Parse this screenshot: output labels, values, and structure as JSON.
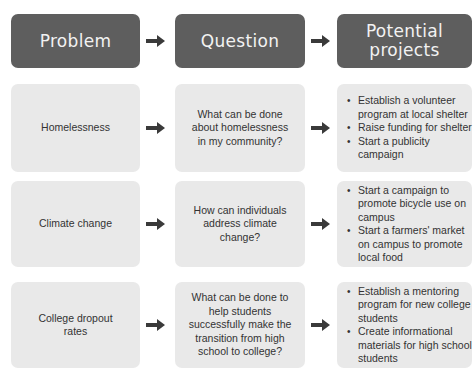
{
  "headers": {
    "problem": "Problem",
    "question": "Question",
    "projects_line1": "Potential",
    "projects_line2": "projects"
  },
  "rows": [
    {
      "problem": "Homelessness",
      "question": "What can be done about homelessness in my community?",
      "projects": [
        "Establish a volunteer program at local shelter",
        "Raise funding for shelter",
        "Start a publicity campaign"
      ]
    },
    {
      "problem": "Climate change",
      "question": "How can individuals address climate change?",
      "projects": [
        "Start a campaign to promote bicycle use on campus",
        "Start a farmers' market on campus to promote local food"
      ]
    },
    {
      "problem": "College dropout rates",
      "question": "What can be done to help students successfully make the transition from high school to college?",
      "projects": [
        "Establish a mentoring program for new college students",
        "Create informational materials for high school students"
      ]
    }
  ],
  "colors": {
    "header_bg": "#5e5e5e",
    "header_text": "#f2f2f2",
    "cell_bg": "#e9e9e9",
    "cell_text": "#333333",
    "arrow": "#3a3a3a"
  },
  "icons": {
    "arrow": "right-arrow-icon"
  }
}
